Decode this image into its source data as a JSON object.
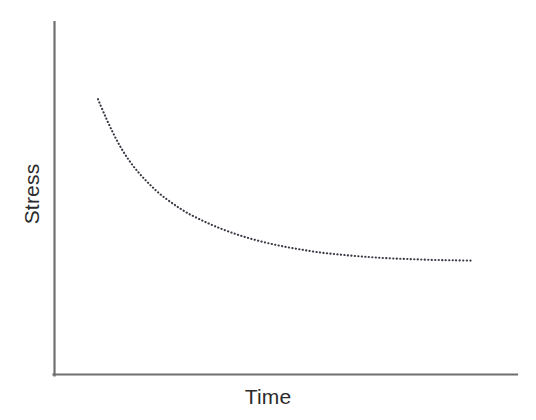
{
  "figure": {
    "background_color": "#ffffff",
    "axis_color": "#6e6e6e",
    "curve_color": "#3a3a45"
  },
  "axes": {
    "x_label": "Time",
    "y_label": "Stress",
    "x_axis_name": "time-axis",
    "y_axis_name": "stress-axis"
  },
  "chart_data": {
    "type": "line",
    "title": "",
    "subtitle": "",
    "xlabel": "Time",
    "ylabel": "Stress",
    "xlim": [
      0,
      100
    ],
    "ylim": [
      0,
      100
    ],
    "grid": false,
    "legend": null,
    "tick_labels": {
      "x": [],
      "y": []
    },
    "annotations": [],
    "series": [
      {
        "name": "Stress relaxation",
        "line_style": "dotted",
        "color": "#3a3a45",
        "marker": "none",
        "x": [
          9.4,
          11.0,
          12.6,
          14.3,
          16.2,
          18.3,
          20.6,
          23.0,
          25.7,
          28.5,
          31.6,
          34.8,
          38.2,
          41.7,
          45.4,
          49.2,
          53.1,
          57.0,
          61.1,
          65.2,
          69.3,
          73.5,
          77.7,
          81.9,
          86.1,
          90.4
        ],
        "y": [
          78.1,
          73.2,
          68.7,
          64.5,
          60.6,
          57.1,
          53.9,
          51.0,
          48.4,
          46.0,
          43.9,
          42.0,
          40.3,
          38.8,
          37.5,
          36.4,
          35.5,
          34.7,
          34.1,
          33.6,
          33.2,
          32.9,
          32.7,
          32.5,
          32.4,
          32.3
        ]
      }
    ]
  }
}
